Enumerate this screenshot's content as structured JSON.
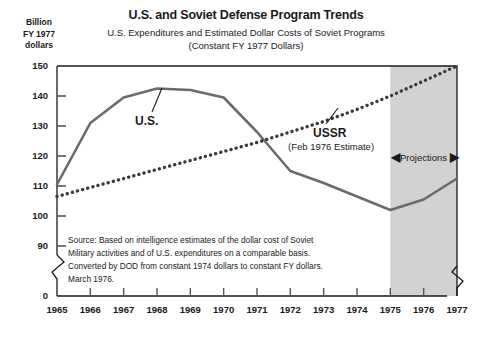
{
  "header": {
    "title": "U.S. and Soviet Defense Program Trends",
    "subtitle_line1": "U.S. Expenditures and Estimated Dollar Costs of Soviet Programs",
    "subtitle_line2": "(Constant FY 1977 Dollars)",
    "unit_label": "Billion\nFY 1977\ndollars",
    "unit_line1": "Billion",
    "unit_line2": "FY 1977",
    "unit_line3": "dollars"
  },
  "annotations": {
    "us_label": "U.S.",
    "ussr_label": "USSR",
    "ussr_sublabel": "(Feb 1976 Estimate)",
    "projections_label": "Projections",
    "arrow_left": "◀",
    "arrow_right": "▶"
  },
  "source": {
    "line1": "Source: Based on intelligence estimates of the dollar cost of Soviet",
    "line2": "Military activities and of U.S. expenditures on a comparable basis.",
    "line3": "Converted by DOD from constant 1974 dollars to constant FY dollars.",
    "line4": "March 1976."
  },
  "colors": {
    "line_us": "#6b6b6b",
    "line_ussr": "#3a3a3a",
    "projection_band": "#d2d2d2",
    "axis": "#1a1a1a",
    "background": "#ffffff"
  },
  "chart_data": {
    "type": "line",
    "title": "U.S. and Soviet Defense Program Trends",
    "subtitle": "U.S. Expenditures and Estimated Dollar Costs of Soviet Programs (Constant FY 1977 Dollars)",
    "xlabel": "",
    "ylabel": "Billion FY 1977 dollars",
    "x": [
      1965,
      1966,
      1967,
      1968,
      1969,
      1970,
      1971,
      1972,
      1973,
      1974,
      1975,
      1976,
      1977
    ],
    "xtick_labels": [
      "1965",
      "1966",
      "1967",
      "1968",
      "1969",
      "1970",
      "1971",
      "1972",
      "1973",
      "1974",
      "1975",
      "1976",
      "1977"
    ],
    "ytick_labels": [
      "150",
      "140",
      "130",
      "120",
      "110",
      "100",
      "90",
      "0"
    ],
    "ytick_values": [
      150,
      140,
      130,
      120,
      110,
      100,
      90,
      0
    ],
    "ylim": [
      90,
      150
    ],
    "y_axis_break": true,
    "x_axis_break": true,
    "grid": false,
    "legend": "inline-annotations",
    "series": [
      {
        "name": "U.S.",
        "style": "solid",
        "color": "#6b6b6b",
        "values": [
          110.5,
          131.0,
          139.5,
          142.5,
          142.0,
          139.5,
          128.0,
          115.0,
          111.0,
          106.5,
          102.0,
          105.5,
          112.5
        ]
      },
      {
        "name": "USSR (Feb 1976 Estimate)",
        "style": "dotted",
        "color": "#3a3a3a",
        "values": [
          106.5,
          109.5,
          112.5,
          115.5,
          118.5,
          121.5,
          124.5,
          128.0,
          131.5,
          135.5,
          140.0,
          145.0,
          150.0
        ]
      }
    ],
    "shaded_region": {
      "label": "Projections",
      "x_start": 1975,
      "x_end": 1977
    }
  }
}
